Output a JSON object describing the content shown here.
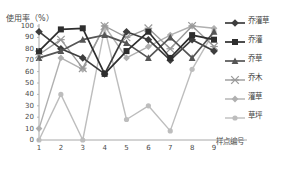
{
  "axes": {
    "y_title": "使用率（%）",
    "x_title": "样点编号",
    "y_ticks": [
      "100",
      "90",
      "80",
      "70",
      "60",
      "50",
      "40",
      "30",
      "20",
      "10",
      "0"
    ],
    "x_ticks": [
      "1",
      "2",
      "3",
      "4",
      "5",
      "6",
      "7",
      "8",
      "9"
    ]
  },
  "legend": {
    "items": [
      {
        "label": "乔灌草",
        "marker": "diamond-marker",
        "color": "#3d3d3d"
      },
      {
        "label": "乔灌",
        "marker": "square-marker",
        "color": "#2e2e2e"
      },
      {
        "label": "乔草",
        "marker": "triangle-marker",
        "color": "#555555"
      },
      {
        "label": "乔木",
        "marker": "cross-marker",
        "color": "#9a9a9a"
      },
      {
        "label": "灌草",
        "marker": "diamond-marker",
        "color": "#b0b0b0"
      },
      {
        "label": "草坪",
        "marker": "circle-marker",
        "color": "#bdbdbd"
      }
    ]
  },
  "chart_data": {
    "type": "line",
    "title": "",
    "xlabel": "样点编号",
    "ylabel": "使用率（%）",
    "xlim": [
      1,
      9
    ],
    "ylim": [
      0,
      100
    ],
    "grid": false,
    "legend_position": "right",
    "categories": [
      "1",
      "2",
      "3",
      "4",
      "5",
      "6",
      "7",
      "8",
      "9"
    ],
    "series": [
      {
        "name": "乔灌草",
        "marker": "diamond",
        "color": "#3d3d3d",
        "values": [
          95,
          80,
          72,
          58,
          95,
          88,
          70,
          88,
          78
        ]
      },
      {
        "name": "乔灌",
        "marker": "square",
        "color": "#2e2e2e",
        "values": [
          78,
          97,
          98,
          58,
          78,
          95,
          72,
          92,
          88
        ]
      },
      {
        "name": "乔草",
        "marker": "triangle",
        "color": "#555555",
        "values": [
          72,
          78,
          88,
          92,
          85,
          72,
          90,
          72,
          95
        ]
      },
      {
        "name": "乔木",
        "marker": "cross",
        "color": "#9a9a9a",
        "values": [
          75,
          88,
          63,
          100,
          90,
          98,
          80,
          100,
          82
        ]
      },
      {
        "name": "灌草",
        "marker": "diamond",
        "color": "#b0b0b0",
        "values": [
          10,
          72,
          62,
          100,
          72,
          82,
          92,
          100,
          98
        ]
      },
      {
        "name": "草坪",
        "marker": "circle",
        "color": "#bdbdbd",
        "values": [
          0,
          40,
          0,
          98,
          18,
          30,
          8,
          62,
          95
        ]
      }
    ]
  }
}
